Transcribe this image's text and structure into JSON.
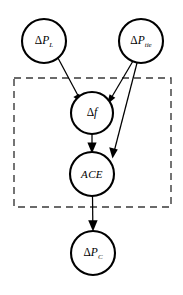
{
  "diagram": {
    "type": "directed-graph",
    "width": 183,
    "height": 295,
    "background_color": "#ffffff",
    "node_fill": "#ffffff",
    "node_stroke": "#000000",
    "edge_color": "#000000",
    "plate_stroke": "#3a3a3a",
    "nodes": [
      {
        "id": "delta-p-l",
        "name": "delta-p-l-node",
        "delta": "Δ",
        "base": "P",
        "subscript": "L",
        "full_label": "ΔP_L",
        "cx": 44,
        "cy": 41,
        "r": 22
      },
      {
        "id": "delta-p-tie",
        "name": "delta-p-tie-node",
        "delta": "Δ",
        "base": "P",
        "subscript": "tie",
        "full_label": "ΔP_tie",
        "cx": 141,
        "cy": 41,
        "r": 22
      },
      {
        "id": "delta-f",
        "name": "delta-f-node",
        "delta": "Δ",
        "base": "f",
        "subscript": "",
        "full_label": "Δf",
        "cx": 92,
        "cy": 113,
        "r": 21
      },
      {
        "id": "ace",
        "name": "ace-node",
        "delta": "",
        "base": "ACE",
        "subscript": "",
        "full_label": "ACE",
        "cx": 92,
        "cy": 174,
        "r": 22
      },
      {
        "id": "delta-p-c",
        "name": "delta-p-c-node",
        "delta": "Δ",
        "base": "P",
        "subscript": "C",
        "full_label": "ΔP_C",
        "cx": 93,
        "cy": 253,
        "r": 22
      }
    ],
    "edges": [
      {
        "id": "edge-pl-to-df",
        "name": "edge-delta-p-l-to-delta-f",
        "from": "delta-p-l",
        "to": "delta-f"
      },
      {
        "id": "edge-ptie-to-df",
        "name": "edge-delta-p-tie-to-delta-f",
        "from": "delta-p-tie",
        "to": "delta-f"
      },
      {
        "id": "edge-ptie-to-ace",
        "name": "edge-delta-p-tie-to-ace",
        "from": "delta-p-tie",
        "to": "ace"
      },
      {
        "id": "edge-df-to-ace",
        "name": "edge-delta-f-to-ace",
        "from": "delta-f",
        "to": "ace"
      },
      {
        "id": "edge-ace-to-pc",
        "name": "edge-ace-to-delta-p-c",
        "from": "ace",
        "to": "delta-p-c"
      }
    ],
    "plate": {
      "name": "dashed-plate-boundary",
      "x": 14,
      "y": 78,
      "width": 157,
      "height": 129,
      "label": ""
    }
  }
}
